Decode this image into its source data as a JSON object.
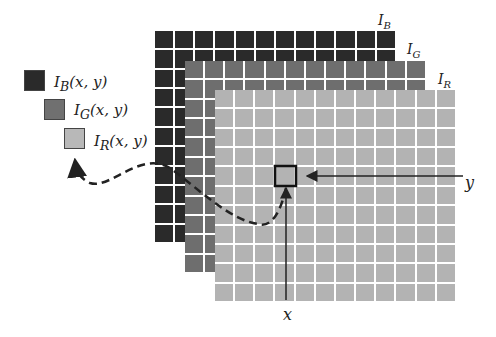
{
  "layers": [
    {
      "name": "I",
      "sub": "B",
      "color": "#2a2a2a"
    },
    {
      "name": "I",
      "sub": "G",
      "color": "#6e6e6e"
    },
    {
      "name": "I",
      "sub": "R",
      "color": "#b3b3b3"
    }
  ],
  "legend": [
    {
      "name": "I",
      "sub": "B",
      "args": "(x, y)",
      "color": "#2a2a2a"
    },
    {
      "name": "I",
      "sub": "G",
      "args": "(x, y)",
      "color": "#707070"
    },
    {
      "name": "I",
      "sub": "R",
      "args": "(x, y)",
      "color": "#b8b8b8"
    }
  ],
  "axes": {
    "x_label": "x",
    "y_label": "y"
  },
  "grid": {
    "cols": 12,
    "rows": 11
  }
}
